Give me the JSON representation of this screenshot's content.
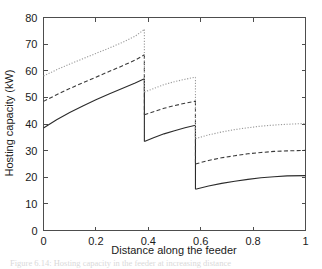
{
  "chart_data": {
    "type": "line",
    "title": "",
    "xlabel": "Distance along the feeder",
    "ylabel": "Hosting capacity (kW)",
    "xlim": [
      0,
      1
    ],
    "ylim": [
      0,
      80
    ],
    "xticks": [
      "0",
      "0.2",
      "0.4",
      "0.6",
      "0.8",
      "1"
    ],
    "xtick_values": [
      0,
      0.2,
      0.4,
      0.6,
      0.8,
      1
    ],
    "yticks": [
      "0",
      "10",
      "20",
      "30",
      "40",
      "50",
      "60",
      "70",
      "80"
    ],
    "ytick_values": [
      0,
      10,
      20,
      30,
      40,
      50,
      60,
      70,
      80
    ],
    "grid": false,
    "legend": "none",
    "discontinuities": [
      0.385,
      0.58
    ],
    "series": [
      {
        "name": "solid-curve",
        "style": "solid",
        "color": "#2b2b2b",
        "segments": [
          {
            "x": [
              0,
              0.05,
              0.1,
              0.15,
              0.2,
              0.25,
              0.3,
              0.35,
              0.385
            ],
            "y": [
              38.5,
              41.6,
              44.3,
              46.8,
              49.1,
              51.3,
              53.3,
              55.4,
              57.0
            ]
          },
          {
            "x": [
              0.385,
              0.42,
              0.46,
              0.5,
              0.54,
              0.58
            ],
            "y": [
              33.4,
              34.8,
              36.3,
              37.5,
              38.6,
              39.5
            ]
          },
          {
            "x": [
              0.58,
              0.63,
              0.68,
              0.73,
              0.78,
              0.83,
              0.88,
              0.93,
              1
            ],
            "y": [
              15.5,
              16.7,
              17.7,
              18.5,
              19.2,
              19.8,
              20.2,
              20.5,
              20.6
            ]
          }
        ]
      },
      {
        "name": "dashed-curve",
        "style": "dashed",
        "color": "#3a3a3a",
        "segments": [
          {
            "x": [
              0,
              0.05,
              0.1,
              0.15,
              0.2,
              0.25,
              0.3,
              0.35,
              0.385
            ],
            "y": [
              48.5,
              51.0,
              53.3,
              55.5,
              57.6,
              59.7,
              61.8,
              64.0,
              66.0
            ]
          },
          {
            "x": [
              0.385,
              0.42,
              0.46,
              0.5,
              0.54,
              0.58
            ],
            "y": [
              43.5,
              44.6,
              45.9,
              46.9,
              47.8,
              48.6
            ]
          },
          {
            "x": [
              0.58,
              0.63,
              0.68,
              0.73,
              0.78,
              0.83,
              0.88,
              0.93,
              1
            ],
            "y": [
              25.0,
              26.3,
              27.3,
              28.1,
              28.8,
              29.3,
              29.7,
              29.9,
              30.1
            ]
          }
        ]
      },
      {
        "name": "dotted-curve",
        "style": "dotted",
        "color": "#9a9a9a",
        "segments": [
          {
            "x": [
              0,
              0.05,
              0.1,
              0.15,
              0.2,
              0.25,
              0.3,
              0.35,
              0.385
            ],
            "y": [
              58.0,
              60.4,
              62.5,
              64.5,
              66.5,
              68.5,
              70.6,
              73.0,
              75.5
            ]
          },
          {
            "x": [
              0.385,
              0.42,
              0.46,
              0.5,
              0.54,
              0.58
            ],
            "y": [
              52.0,
              53.3,
              54.8,
              55.9,
              56.8,
              57.6
            ]
          },
          {
            "x": [
              0.58,
              0.63,
              0.68,
              0.73,
              0.78,
              0.83,
              0.88,
              0.93,
              1
            ],
            "y": [
              34.5,
              35.9,
              37.0,
              37.9,
              38.6,
              39.2,
              39.6,
              39.9,
              40.2
            ]
          }
        ]
      }
    ]
  },
  "caption": {
    "text": "Figure 6.14: Hosting capacity in the feeder at increasing distance"
  }
}
